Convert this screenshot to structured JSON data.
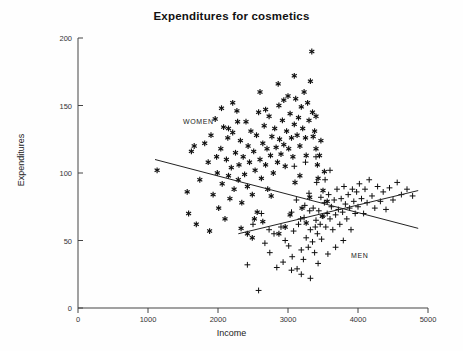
{
  "chart_data": {
    "type": "scatter",
    "title": "Expenditures for cosmetics",
    "xlabel": "Income",
    "ylabel": "Expenditures",
    "xlim": [
      0,
      5000
    ],
    "ylim": [
      0,
      200
    ],
    "xticks": [
      0,
      1000,
      2000,
      3000,
      4000,
      5000
    ],
    "yticks": [
      0,
      50,
      100,
      150,
      200
    ],
    "grid": false,
    "legend": "inline-annotations",
    "annotations": [
      {
        "text": "WOMEN",
        "x": 1500,
        "y": 136
      },
      {
        "text": "MEN",
        "x": 3900,
        "y": 37
      }
    ],
    "series": [
      {
        "name": "WOMEN",
        "marker": "asterisk",
        "color": "#111111",
        "points": [
          [
            1130,
            102
          ],
          [
            1560,
            86
          ],
          [
            1580,
            70
          ],
          [
            1620,
            116
          ],
          [
            1660,
            120
          ],
          [
            1690,
            62
          ],
          [
            1740,
            95
          ],
          [
            1810,
            122
          ],
          [
            1860,
            108
          ],
          [
            1880,
            57
          ],
          [
            1900,
            128
          ],
          [
            1930,
            84
          ],
          [
            1960,
            140
          ],
          [
            1990,
            100
          ],
          [
            2010,
            74
          ],
          [
            2040,
            118
          ],
          [
            2060,
            92
          ],
          [
            2080,
            134
          ],
          [
            2100,
            66
          ],
          [
            2120,
            110
          ],
          [
            2140,
            126
          ],
          [
            2150,
            98
          ],
          [
            2170,
            81
          ],
          [
            2190,
            104
          ],
          [
            2210,
            130
          ],
          [
            2230,
            88
          ],
          [
            2250,
            115
          ],
          [
            2270,
            146
          ],
          [
            2290,
            95
          ],
          [
            2300,
            106
          ],
          [
            2320,
            124
          ],
          [
            2340,
            78
          ],
          [
            2360,
            112
          ],
          [
            2380,
            99
          ],
          [
            2400,
            138
          ],
          [
            2420,
            90
          ],
          [
            2430,
            120
          ],
          [
            2450,
            108
          ],
          [
            2470,
            131
          ],
          [
            2490,
            84
          ],
          [
            2510,
            116
          ],
          [
            2530,
            102
          ],
          [
            2550,
            128
          ],
          [
            2560,
            71
          ],
          [
            2580,
            145
          ],
          [
            2600,
            110
          ],
          [
            2620,
            96
          ],
          [
            2640,
            122
          ],
          [
            2660,
            135
          ],
          [
            2680,
            106
          ],
          [
            2700,
            118
          ],
          [
            2710,
            88
          ],
          [
            2730,
            142
          ],
          [
            2750,
            113
          ],
          [
            2770,
            127
          ],
          [
            2790,
            100
          ],
          [
            2810,
            133
          ],
          [
            2830,
            119
          ],
          [
            2850,
            108
          ],
          [
            2870,
            150
          ],
          [
            2880,
            125
          ],
          [
            2900,
            114
          ],
          [
            2920,
            139
          ],
          [
            2940,
            121
          ],
          [
            2960,
            105
          ],
          [
            2980,
            131
          ],
          [
            3000,
            157
          ],
          [
            3010,
            118
          ],
          [
            3030,
            144
          ],
          [
            3050,
            126
          ],
          [
            3070,
            112
          ],
          [
            3090,
            136
          ],
          [
            3110,
            155
          ],
          [
            3130,
            128
          ],
          [
            3150,
            141
          ],
          [
            3170,
            120
          ],
          [
            3190,
            149
          ],
          [
            3210,
            133
          ],
          [
            3230,
            160
          ],
          [
            3250,
            126
          ],
          [
            3260,
            113
          ],
          [
            3280,
            152
          ],
          [
            3300,
            139
          ],
          [
            3320,
            168
          ],
          [
            3340,
            190
          ],
          [
            3350,
            145
          ],
          [
            3360,
            127
          ],
          [
            3380,
            131
          ],
          [
            3400,
            118
          ],
          [
            3420,
            106
          ],
          [
            3430,
            96
          ],
          [
            3450,
            113
          ],
          [
            3470,
            124
          ],
          [
            3500,
            87
          ],
          [
            3520,
            101
          ],
          [
            3560,
            79
          ],
          [
            2210,
            152
          ],
          [
            2330,
            59
          ],
          [
            2490,
            52
          ],
          [
            2640,
            64
          ],
          [
            2870,
            55
          ],
          [
            3030,
            69
          ],
          [
            3200,
            74
          ],
          [
            3310,
            82
          ],
          [
            3100,
            93
          ],
          [
            2760,
            83
          ],
          [
            2280,
            138
          ],
          [
            2150,
            133
          ],
          [
            1980,
            112
          ],
          [
            2050,
            148
          ],
          [
            2600,
            160
          ],
          [
            2860,
            166
          ],
          [
            3090,
            172
          ],
          [
            2420,
            55
          ],
          [
            2520,
            66
          ],
          [
            2960,
            60
          ],
          [
            3260,
            63
          ],
          [
            3490,
            68
          ],
          [
            2680,
            147
          ],
          [
            2940,
            154
          ],
          [
            3170,
            98
          ],
          [
            3400,
            142
          ]
        ]
      },
      {
        "name": "MEN",
        "marker": "plus",
        "color": "#111111",
        "points": [
          [
            2580,
            13
          ],
          [
            2420,
            32
          ],
          [
            2740,
            41
          ],
          [
            2840,
            30
          ],
          [
            2930,
            34
          ],
          [
            3010,
            46
          ],
          [
            3060,
            38
          ],
          [
            3130,
            29
          ],
          [
            3190,
            43
          ],
          [
            3220,
            36
          ],
          [
            3260,
            52
          ],
          [
            3290,
            45
          ],
          [
            3320,
            58
          ],
          [
            3350,
            49
          ],
          [
            3380,
            41
          ],
          [
            3400,
            65
          ],
          [
            3420,
            55
          ],
          [
            3440,
            72
          ],
          [
            3460,
            62
          ],
          [
            3480,
            51
          ],
          [
            3500,
            68
          ],
          [
            3520,
            78
          ],
          [
            3540,
            60
          ],
          [
            3560,
            70
          ],
          [
            3580,
            84
          ],
          [
            3600,
            66
          ],
          [
            3620,
            75
          ],
          [
            3640,
            58
          ],
          [
            3660,
            80
          ],
          [
            3680,
            69
          ],
          [
            3700,
            88
          ],
          [
            3720,
            73
          ],
          [
            3740,
            62
          ],
          [
            3760,
            81
          ],
          [
            3780,
            71
          ],
          [
            3800,
            90
          ],
          [
            3820,
            77
          ],
          [
            3840,
            66
          ],
          [
            3860,
            84
          ],
          [
            3880,
            74
          ],
          [
            3900,
            58
          ],
          [
            3920,
            88
          ],
          [
            3940,
            79
          ],
          [
            3960,
            70
          ],
          [
            3980,
            86
          ],
          [
            4000,
            75
          ],
          [
            4020,
            92
          ],
          [
            4050,
            81
          ],
          [
            4080,
            70
          ],
          [
            4100,
            88
          ],
          [
            4130,
            78
          ],
          [
            4160,
            95
          ],
          [
            4200,
            83
          ],
          [
            4240,
            74
          ],
          [
            4280,
            90
          ],
          [
            4320,
            79
          ],
          [
            4360,
            86
          ],
          [
            4400,
            73
          ],
          [
            4450,
            89
          ],
          [
            4500,
            80
          ],
          [
            4560,
            93
          ],
          [
            4620,
            84
          ],
          [
            4700,
            88
          ],
          [
            4780,
            83
          ],
          [
            2900,
            60
          ],
          [
            3050,
            71
          ],
          [
            3120,
            80
          ],
          [
            3180,
            66
          ],
          [
            3240,
            76
          ],
          [
            3300,
            85
          ],
          [
            3360,
            74
          ],
          [
            3410,
            93
          ],
          [
            3470,
            82
          ],
          [
            3530,
            95
          ],
          [
            3600,
            102
          ],
          [
            2960,
            50
          ],
          [
            3080,
            57
          ],
          [
            3150,
            62
          ],
          [
            3230,
            67
          ],
          [
            3310,
            72
          ],
          [
            3390,
            60
          ],
          [
            2800,
            55
          ],
          [
            2670,
            48
          ],
          [
            3050,
            28
          ],
          [
            3190,
            25
          ],
          [
            3320,
            22
          ],
          [
            3430,
            33
          ],
          [
            3570,
            40
          ],
          [
            3680,
            45
          ],
          [
            3790,
            50
          ],
          [
            2500,
            62
          ],
          [
            2620,
            70
          ],
          [
            2730,
            58
          ],
          [
            3090,
            105
          ],
          [
            3250,
            108
          ],
          [
            3400,
            112
          ]
        ]
      }
    ],
    "trend_lines": [
      {
        "name": "WOMEN",
        "x0": 1100,
        "y0": 110,
        "x1": 4860,
        "y1": 59,
        "slope_sign": "negative"
      },
      {
        "name": "MEN",
        "x0": 2290,
        "y0": 55,
        "x1": 4860,
        "y1": 87,
        "slope_sign": "positive"
      }
    ]
  }
}
